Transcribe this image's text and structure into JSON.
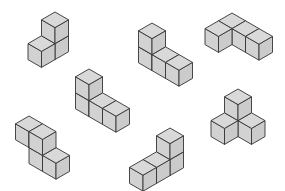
{
  "figure": {
    "width": 285,
    "height": 191,
    "colors": {
      "background": "#ffffff",
      "stroke": "#333333",
      "top_face": "#d9d9d9",
      "left_face": "#d2d2d2",
      "right_face": "#cbcbcb"
    },
    "projection": {
      "dx": 13.5,
      "dy": 7.8,
      "dz": 16
    }
  },
  "shapes": [
    {
      "id": "shape-1",
      "label": "Shape 1",
      "origin": [
        55,
        28
      ],
      "cubes": [
        [
          0,
          0,
          0
        ],
        [
          0,
          0,
          1
        ],
        [
          0,
          1,
          0
        ]
      ]
    },
    {
      "id": "shape-2",
      "label": "Shape 2",
      "origin": [
        152,
        39
      ],
      "cubes": [
        [
          0,
          0,
          0
        ],
        [
          0,
          0,
          1
        ],
        [
          1,
          0,
          0
        ],
        [
          2,
          0,
          0
        ]
      ]
    },
    {
      "id": "shape-3",
      "label": "Shape 3",
      "origin": [
        232,
        13
      ],
      "cubes": [
        [
          0,
          0,
          0
        ],
        [
          1,
          0,
          0
        ],
        [
          2,
          0,
          0
        ],
        [
          0,
          1,
          0
        ]
      ]
    },
    {
      "id": "shape-4",
      "label": "Shape 4",
      "origin": [
        89,
        85
      ],
      "cubes": [
        [
          0,
          0,
          0
        ],
        [
          0,
          0,
          1
        ],
        [
          1,
          0,
          0
        ],
        [
          2,
          0,
          0
        ]
      ]
    },
    {
      "id": "shape-5",
      "label": "Shape 5",
      "origin": [
        29,
        132
      ],
      "cubes": [
        [
          0,
          0,
          1
        ],
        [
          1,
          0,
          1
        ],
        [
          1,
          0,
          0
        ],
        [
          2,
          0,
          0
        ]
      ]
    },
    {
      "id": "shape-6",
      "label": "Shape 6",
      "origin": [
        170,
        144
      ],
      "cubes": [
        [
          0,
          0,
          0
        ],
        [
          0,
          0,
          1
        ],
        [
          0,
          1,
          0
        ],
        [
          0,
          2,
          0
        ]
      ]
    },
    {
      "id": "shape-7",
      "label": "Shape 7",
      "origin": [
        238,
        105
      ],
      "cubes": [
        [
          0,
          0,
          0
        ],
        [
          0,
          0,
          1
        ],
        [
          1,
          0,
          0
        ],
        [
          0,
          1,
          0
        ]
      ]
    }
  ]
}
